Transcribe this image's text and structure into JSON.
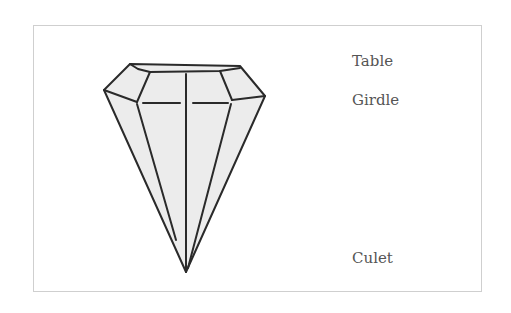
{
  "diagram": {
    "labels": {
      "table": "Table",
      "girdle": "Girdle",
      "culet": "Culet"
    },
    "colors": {
      "stroke": "#2a2a2a",
      "fill": "#ececec",
      "frame": "#cfcfcf",
      "label": "#555555"
    }
  }
}
